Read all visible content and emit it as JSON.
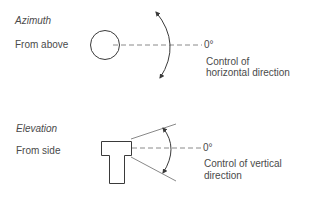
{
  "azimuth": {
    "title": "Azimuth",
    "view": "From above",
    "zero_label": "0°",
    "caption_line1": "Control of",
    "caption_line2": "horizontal direction"
  },
  "elevation": {
    "title": "Elevation",
    "view": "From side",
    "zero_label": "0°",
    "caption_line1": "Control of vertical",
    "caption_line2": "direction"
  },
  "colors": {
    "stroke": "#3a3a3a",
    "dash": "#8a8a8a",
    "text": "#4a4a4a"
  }
}
